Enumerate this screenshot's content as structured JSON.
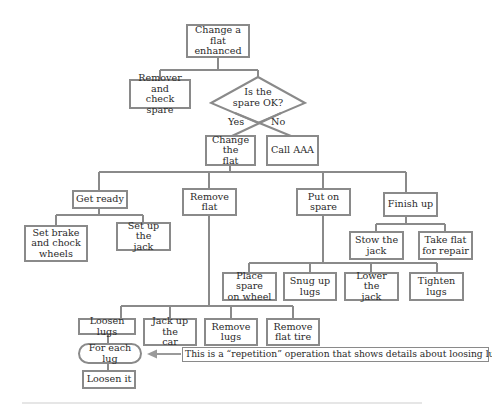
{
  "diagram": {
    "root": {
      "label": "Change a\nflat\nenhanced"
    },
    "prep": {
      "label": "Remover and\ncheck spare"
    },
    "decision": {
      "label": "Is the\nspare OK?",
      "yes_label": "Yes",
      "no_label": "No"
    },
    "yes_branch": {
      "label": "Change the\nflat"
    },
    "no_branch": {
      "label": "Call AAA"
    },
    "steps": [
      {
        "label": "Get ready",
        "children": [
          {
            "label": "Set brake\nand chock\nwheels"
          },
          {
            "label": "Set up the\njack"
          }
        ]
      },
      {
        "label": "Remove\nflat",
        "children": [
          {
            "label": "Loosen lugs"
          },
          {
            "label": "Jack up the\ncar"
          },
          {
            "label": "Remove\nlugs"
          },
          {
            "label": "Remove\nflat tire"
          }
        ]
      },
      {
        "label": "Put on\nspare",
        "children": [
          {
            "label": "Place spare\non wheel"
          },
          {
            "label": "Snug up\nlugs"
          },
          {
            "label": "Lower the\njack"
          },
          {
            "label": "Tighten\nlugs"
          }
        ]
      },
      {
        "label": "Finish up",
        "children": [
          {
            "label": "Stow the\njack"
          },
          {
            "label": "Take flat\nfor repair"
          }
        ]
      }
    ],
    "repetition": {
      "loop_label": "For each lug",
      "body_label": "Loosen it",
      "note": "This is a “repetition” operation that shows details about loosing lugs."
    },
    "colors": {
      "line": "#8a8a8a",
      "text": "#2a2a2a",
      "background": "#ffffff"
    }
  }
}
